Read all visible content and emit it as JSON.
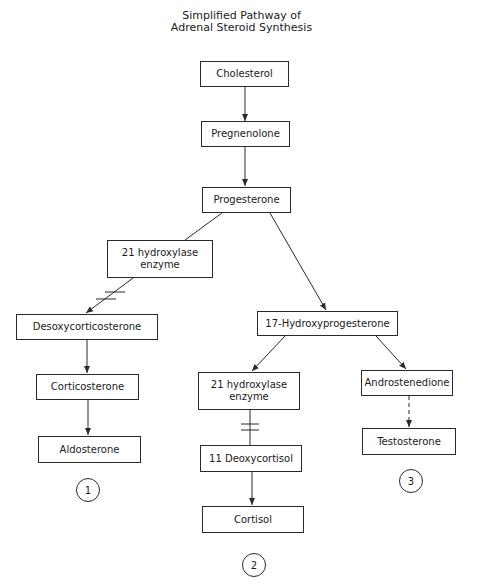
{
  "title": {
    "line1": "Simplified Pathway of",
    "line2": "Adrenal Steroid Synthesis"
  },
  "nodes": {
    "cholesterol": "Cholesterol",
    "pregnenolone": "Pregnenolone",
    "progesterone": "Progesterone",
    "enzyme_left_line1": "21 hydroxylase",
    "enzyme_left_line2": "enzyme",
    "desoxycorticosterone": "Desoxycorticosterone",
    "corticosterone": "Corticosterone",
    "aldosterone": "Aldosterone",
    "hydroxyprogesterone": "17-Hydroxyprogesterone",
    "enzyme_mid_line1": "21 hydroxylase",
    "enzyme_mid_line2": "enzyme",
    "deoxycortisol": "11 Deoxycortisol",
    "cortisol": "Cortisol",
    "androstenedione": "Androstenedione",
    "testosterone": "Testosterone"
  },
  "pathway_labels": {
    "p1": "1",
    "p2": "2",
    "p3": "3"
  },
  "edges": [
    {
      "from": "cholesterol",
      "to": "pregnenolone",
      "style": "solid"
    },
    {
      "from": "pregnenolone",
      "to": "progesterone",
      "style": "solid"
    },
    {
      "from": "progesterone",
      "to": "enzyme_left",
      "style": "solid"
    },
    {
      "from": "enzyme_left",
      "to": "desoxycorticosterone",
      "style": "blocked"
    },
    {
      "from": "desoxycorticosterone",
      "to": "corticosterone",
      "style": "solid"
    },
    {
      "from": "corticosterone",
      "to": "aldosterone",
      "style": "solid"
    },
    {
      "from": "progesterone",
      "to": "hydroxyprogesterone",
      "style": "solid"
    },
    {
      "from": "hydroxyprogesterone",
      "to": "enzyme_mid",
      "style": "solid"
    },
    {
      "from": "enzyme_mid",
      "to": "deoxycortisol",
      "style": "blocked"
    },
    {
      "from": "deoxycortisol",
      "to": "cortisol",
      "style": "solid"
    },
    {
      "from": "hydroxyprogesterone",
      "to": "androstenedione",
      "style": "solid"
    },
    {
      "from": "androstenedione",
      "to": "testosterone",
      "style": "dashed"
    }
  ],
  "colors": {
    "line": "#2a2a2a",
    "background": "#ffffff"
  }
}
